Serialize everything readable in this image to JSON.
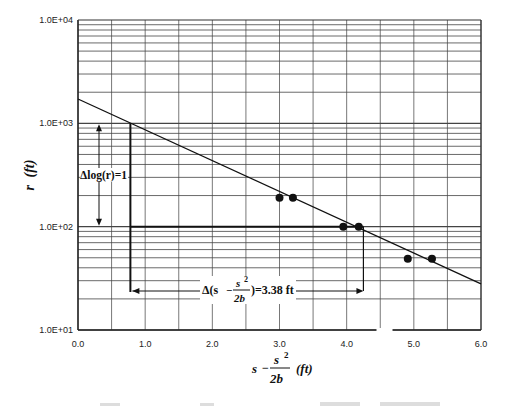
{
  "chart_data": {
    "type": "scatter",
    "title": "",
    "xlabel": "s - s^2/2b (ft)",
    "ylabel": "r (ft)",
    "xlim": [
      0,
      6
    ],
    "ylim": [
      10,
      10000
    ],
    "yscale": "log",
    "grid": true,
    "x_ticks": [
      "0.0",
      "1.0",
      "2.0",
      "3.0",
      "4.0",
      "5.0",
      "6.0"
    ],
    "y_ticks": [
      "1.0E+01",
      "1.0E+02",
      "1.0E+03",
      "1.0E+04"
    ],
    "series": [
      {
        "name": "measured",
        "type": "scatter",
        "points": [
          {
            "x": 3.0,
            "y": 190
          },
          {
            "x": 3.2,
            "y": 190
          },
          {
            "x": 3.95,
            "y": 100
          },
          {
            "x": 4.18,
            "y": 100
          },
          {
            "x": 4.91,
            "y": 49
          },
          {
            "x": 5.27,
            "y": 49
          }
        ]
      },
      {
        "name": "fitted line",
        "type": "line",
        "points": [
          {
            "x": 0.0,
            "y": 1720
          },
          {
            "x": 0.78,
            "y": 1000
          },
          {
            "x": 4.16,
            "y": 100
          },
          {
            "x": 6.0,
            "y": 28
          }
        ]
      }
    ],
    "annotations": [
      {
        "text": "Δlog(r)=1",
        "type": "vertical-arrow",
        "x": 0.3,
        "from": 1000,
        "to": 100
      },
      {
        "text": "Δ(s - s²/2b)=3.38 ft",
        "type": "horizontal-arrow",
        "y": 34,
        "from": 0.78,
        "to": 4.16
      }
    ]
  },
  "labels": {
    "y_axis_var": "r",
    "y_axis_unit": "(ft)",
    "x_axis_s": "s",
    "x_axis_minus": "−",
    "x_axis_num": "s",
    "x_axis_sup": "2",
    "x_axis_den": "2b",
    "x_axis_unit": "(ft)",
    "delta_log": "Δlog(r)=1",
    "delta_x_prefix": "Δ(s",
    "delta_x_minus": "−",
    "delta_x_num": "s",
    "delta_x_sup": "2",
    "delta_x_den": "2b",
    "delta_x_suffix": ")=3.38 ft"
  }
}
